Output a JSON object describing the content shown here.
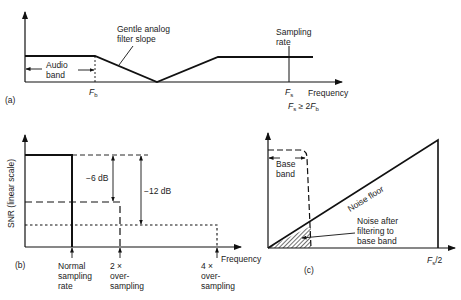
{
  "panel_a": {
    "tag": "(a)",
    "filter_label_line1": "Gentle analog",
    "filter_label_line2": "filter slope",
    "audio_band_line1": "Audio",
    "audio_band_line2": "band",
    "fb_label": "F",
    "fb_sub": "b",
    "sampling_label_line1": "Sampling",
    "sampling_label_line2": "rate",
    "fs_label": "F",
    "fs_sub": "s",
    "x_axis_label": "Frequency",
    "condition_F1": "F",
    "condition_sub1": "s",
    "condition_op": " ≥ 2",
    "condition_F2": "F",
    "condition_sub2": "b"
  },
  "panel_b": {
    "tag": "(b)",
    "y_axis_label": "SNR (linear scale)",
    "x_axis_label": "Frequency",
    "delta1": "−6 dB",
    "delta2": "−12 dB",
    "tick1_line1": "Normal",
    "tick1_line2": "sampling",
    "tick1_line3": "rate",
    "tick2_line1": "2 ×",
    "tick2_line2": "over-",
    "tick2_line3": "sampling",
    "tick3_line1": "4 ×",
    "tick3_line2": "over-",
    "tick3_line3": "sampling"
  },
  "panel_c": {
    "tag": "(c)",
    "baseband_line1": "Base",
    "baseband_line2": "band",
    "noise_floor_label": "Noise floor",
    "noise_after_line1": "Noise after",
    "noise_after_line2": "filtering to",
    "noise_after_line3": "base band",
    "fs2_F": "F",
    "fs2_sub": "s",
    "fs2_rest": "/2"
  }
}
